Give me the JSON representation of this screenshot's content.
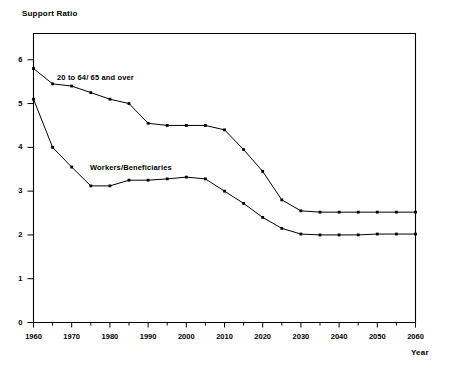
{
  "chart_data": {
    "type": "line",
    "title": "",
    "ylabel": "Support Ratio",
    "xlabel": "Year",
    "xlim": [
      1960,
      2060
    ],
    "ylim": [
      0,
      6.6
    ],
    "grid": false,
    "legend_position": "inline-annotations",
    "xticks": [
      1960,
      1970,
      1980,
      1990,
      2000,
      2010,
      2020,
      2030,
      2040,
      2050,
      2060
    ],
    "xticklabels": [
      "1960",
      "1970",
      "1980",
      "1990",
      "2000",
      "2010",
      "2020",
      "2030",
      "2040",
      "2050",
      "2060"
    ],
    "xminor_ticks": [
      1965,
      1975,
      1985,
      1995,
      2005,
      2015,
      2025,
      2035,
      2045,
      2055
    ],
    "yticks": [
      0,
      1,
      2,
      3,
      4,
      5,
      6
    ],
    "yticklabels": [
      "0",
      "1",
      "2",
      "3",
      "4",
      "5",
      "6"
    ],
    "x": [
      1960,
      1965,
      1970,
      1975,
      1980,
      1985,
      1990,
      1995,
      2000,
      2005,
      2010,
      2015,
      2020,
      2025,
      2030,
      2035,
      2040,
      2045,
      2050,
      2055,
      2060
    ],
    "series": [
      {
        "name": "20 to 64/ 65 and over",
        "color": "#000000",
        "marker": "square",
        "values": [
          5.8,
          5.45,
          5.4,
          5.25,
          5.1,
          5.0,
          4.55,
          4.5,
          4.5,
          4.5,
          4.4,
          3.95,
          3.45,
          2.8,
          2.55,
          2.52,
          2.52,
          2.52,
          2.52,
          2.52,
          2.52
        ]
      },
      {
        "name": "Workers/Beneficiaries",
        "color": "#000000",
        "marker": "square",
        "values": [
          5.1,
          4.0,
          3.55,
          3.12,
          3.12,
          3.25,
          3.25,
          3.28,
          3.32,
          3.28,
          3.0,
          2.72,
          2.4,
          2.15,
          2.02,
          2.0,
          2.0,
          2.0,
          2.02,
          2.02,
          2.02
        ]
      }
    ]
  },
  "axis": {
    "y_title": "Support Ratio",
    "x_title": "Year"
  }
}
